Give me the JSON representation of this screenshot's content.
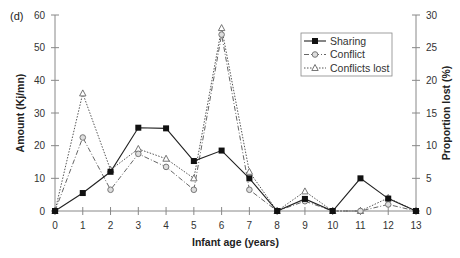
{
  "chart_data": {
    "type": "line",
    "panel_label": "(d)",
    "title": "",
    "xlabel": "Infant age (years)",
    "ylabel": "Amount (Kj/mn)",
    "y2label": "Proportion lost (%)",
    "x": [
      0,
      1,
      2,
      3,
      4,
      5,
      6,
      7,
      8,
      9,
      10,
      11,
      12,
      13
    ],
    "ylim": [
      0,
      60
    ],
    "y2lim": [
      0,
      30
    ],
    "yticks": [
      0,
      10,
      20,
      30,
      40,
      50,
      60
    ],
    "y2ticks": [
      0,
      5,
      10,
      15,
      20,
      25,
      30
    ],
    "grid": false,
    "legend_position": "upper right",
    "series": [
      {
        "name": "Sharing",
        "axis": "left",
        "marker": "filled-square",
        "line": "solid",
        "values": [
          0,
          5.5,
          12,
          25.5,
          25.3,
          15.3,
          18.5,
          10,
          0,
          3.7,
          0,
          10,
          3.8,
          0
        ]
      },
      {
        "name": "Conflict",
        "axis": "left",
        "marker": "open-circle",
        "line": "dash-dot",
        "values": [
          0,
          22.5,
          6.5,
          17.5,
          13.5,
          6.5,
          54,
          6.5,
          0,
          3,
          0,
          0,
          2,
          0
        ]
      },
      {
        "name": "Conflicts lost",
        "axis": "right",
        "marker": "open-triangle",
        "line": "dotted",
        "values": [
          0,
          18,
          6.3,
          9.5,
          8,
          5,
          28,
          6,
          0,
          3,
          0,
          0,
          2,
          0
        ]
      }
    ]
  }
}
